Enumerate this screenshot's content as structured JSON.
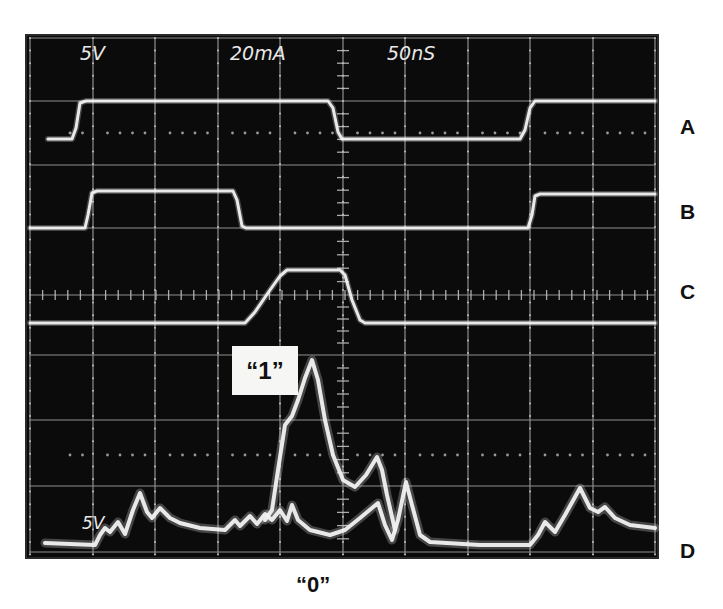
{
  "scope": {
    "screen": {
      "x": 26,
      "y": 35,
      "width": 632,
      "height": 523,
      "background": "#0b0b0b",
      "border": "#2a2a2a"
    },
    "grid": {
      "color": "#bdbdbd",
      "vertical_x": [
        30,
        93,
        155,
        218,
        280,
        343,
        405,
        468,
        530,
        593,
        655
      ],
      "horizontal_y": [
        38,
        101,
        165,
        228,
        295,
        355,
        420,
        486,
        552
      ],
      "center_x": 343,
      "center_y": 295,
      "dotted_y": [
        133,
        455
      ]
    },
    "readout": {
      "ch1_scale": "5V",
      "ch2_scale": "20mA",
      "timebase": "50nS",
      "lower_scale": "5V"
    },
    "trace_color": "#f2f2f2"
  },
  "labels": {
    "trace_a": "A",
    "trace_b": "B",
    "trace_c": "C",
    "trace_d": "D",
    "one": "“1”",
    "zero": "“0”"
  },
  "chart_data": {
    "type": "line",
    "title": "",
    "xlabel": "time (50nS/div)",
    "ylabel": "",
    "grid": true,
    "divisions": {
      "x": 10,
      "y": 8
    },
    "readouts": [
      "5V",
      "20mA",
      "50nS",
      "5V"
    ],
    "series": [
      {
        "name": "A",
        "unit": "5V/div",
        "points": [
          [
            48,
            139
          ],
          [
            72,
            139
          ],
          [
            76,
            128
          ],
          [
            80,
            103
          ],
          [
            86,
            101
          ],
          [
            328,
            101
          ],
          [
            333,
            108
          ],
          [
            338,
            132
          ],
          [
            342,
            139
          ],
          [
            520,
            139
          ],
          [
            525,
            130
          ],
          [
            530,
            108
          ],
          [
            535,
            101
          ],
          [
            655,
            101
          ]
        ]
      },
      {
        "name": "B",
        "unit": "5V/div",
        "points": [
          [
            30,
            228
          ],
          [
            85,
            228
          ],
          [
            88,
            215
          ],
          [
            92,
            193
          ],
          [
            97,
            191
          ],
          [
            233,
            191
          ],
          [
            237,
            200
          ],
          [
            242,
            226
          ],
          [
            246,
            228
          ],
          [
            528,
            228
          ],
          [
            532,
            215
          ],
          [
            535,
            196
          ],
          [
            540,
            194
          ],
          [
            655,
            194
          ]
        ]
      },
      {
        "name": "C",
        "unit": "20mA/div",
        "points": [
          [
            30,
            323
          ],
          [
            245,
            323
          ],
          [
            255,
            312
          ],
          [
            270,
            290
          ],
          [
            280,
            276
          ],
          [
            287,
            270
          ],
          [
            340,
            270
          ],
          [
            345,
            275
          ],
          [
            352,
            300
          ],
          [
            360,
            320
          ],
          [
            365,
            323
          ],
          [
            655,
            323
          ]
        ]
      },
      {
        "name": "D “1”",
        "unit": "5V/div",
        "points": [
          [
            265,
            520
          ],
          [
            272,
            510
          ],
          [
            278,
            470
          ],
          [
            285,
            425
          ],
          [
            292,
            416
          ],
          [
            298,
            400
          ],
          [
            305,
            378
          ],
          [
            312,
            360
          ],
          [
            318,
            380
          ],
          [
            325,
            420
          ],
          [
            333,
            455
          ],
          [
            343,
            480
          ],
          [
            355,
            487
          ],
          [
            366,
            475
          ],
          [
            377,
            457
          ],
          [
            382,
            470
          ],
          [
            387,
            495
          ],
          [
            395,
            530
          ]
        ]
      },
      {
        "name": "D “0”",
        "unit": "5V/div",
        "points": [
          [
            45,
            543
          ],
          [
            95,
            545
          ],
          [
            100,
            535
          ],
          [
            105,
            528
          ],
          [
            110,
            532
          ],
          [
            118,
            522
          ],
          [
            125,
            534
          ],
          [
            133,
            510
          ],
          [
            140,
            493
          ],
          [
            147,
            512
          ],
          [
            152,
            518
          ],
          [
            160,
            508
          ],
          [
            170,
            518
          ],
          [
            180,
            523
          ],
          [
            200,
            528
          ],
          [
            225,
            530
          ],
          [
            235,
            520
          ],
          [
            240,
            526
          ],
          [
            250,
            516
          ],
          [
            257,
            524
          ],
          [
            265,
            514
          ],
          [
            272,
            520
          ],
          [
            280,
            510
          ],
          [
            287,
            521
          ],
          [
            292,
            505
          ],
          [
            298,
            520
          ],
          [
            310,
            530
          ],
          [
            330,
            535
          ],
          [
            345,
            530
          ],
          [
            360,
            518
          ],
          [
            378,
            503
          ],
          [
            385,
            525
          ],
          [
            392,
            540
          ],
          [
            398,
            520
          ],
          [
            406,
            482
          ],
          [
            412,
            505
          ],
          [
            420,
            535
          ],
          [
            430,
            542
          ],
          [
            480,
            545
          ],
          [
            530,
            545
          ],
          [
            538,
            535
          ],
          [
            545,
            522
          ],
          [
            555,
            532
          ],
          [
            565,
            515
          ],
          [
            580,
            488
          ],
          [
            590,
            508
          ],
          [
            598,
            512
          ],
          [
            605,
            507
          ],
          [
            615,
            518
          ],
          [
            630,
            525
          ],
          [
            655,
            528
          ]
        ]
      }
    ],
    "annotations": [
      {
        "text": "A",
        "x": 688,
        "y": 127
      },
      {
        "text": "B",
        "x": 688,
        "y": 212
      },
      {
        "text": "C",
        "x": 688,
        "y": 292
      },
      {
        "text": "D",
        "x": 688,
        "y": 551
      },
      {
        "text": "“1”",
        "x": 265,
        "y": 371
      },
      {
        "text": "“0”",
        "x": 327,
        "y": 585
      }
    ]
  }
}
